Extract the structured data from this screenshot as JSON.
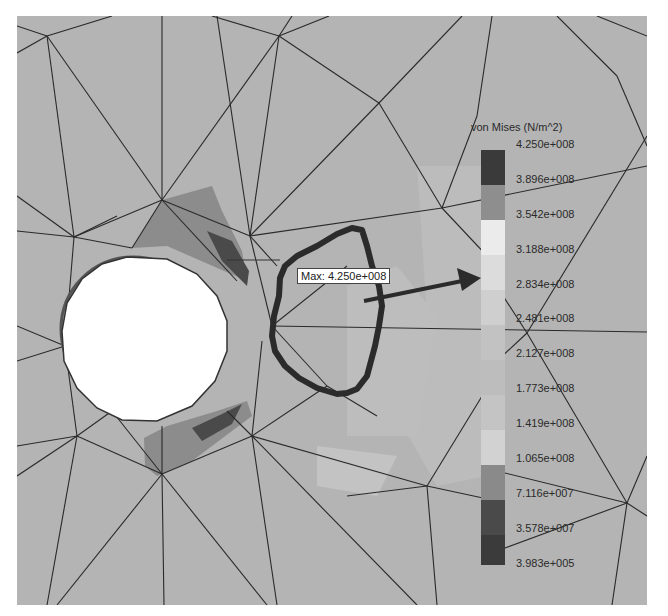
{
  "figure": {
    "type": "FEA von Mises stress contour plot with mesh overlay",
    "max_annotation": "Max: 4.250e+008",
    "annotation_arrow": "arrow from hand-drawn outlined region pointing to legend",
    "hand_drawn_outline": "thick dark freehand loop around low-stress region right of hole"
  },
  "legend": {
    "title": "von Mises (N/m^2)",
    "labels": [
      "4.250e+008",
      "3.896e+008",
      "3.542e+008",
      "3.188e+008",
      "2.834e+008",
      "2.481e+008",
      "2.127e+008",
      "1.773e+008",
      "1.419e+008",
      "1.065e+008",
      "7.116e+007",
      "3.578e+007",
      "3.983e+005"
    ],
    "segment_colors": [
      "#3a3a3a",
      "#8e8e8e",
      "#ebebeb",
      "#dcdcdc",
      "#cfcfcf",
      "#c2c2c2",
      "#bdbdbd",
      "#c4c4c4",
      "#d2d2d2",
      "#8a8a8a",
      "#4a4a4a",
      "#3b3b3b"
    ]
  },
  "colors": {
    "background": "#b4b4b4",
    "mesh_line": "#2a2a2a",
    "hole": "#ffffff",
    "outline": "#2b2b2b"
  }
}
